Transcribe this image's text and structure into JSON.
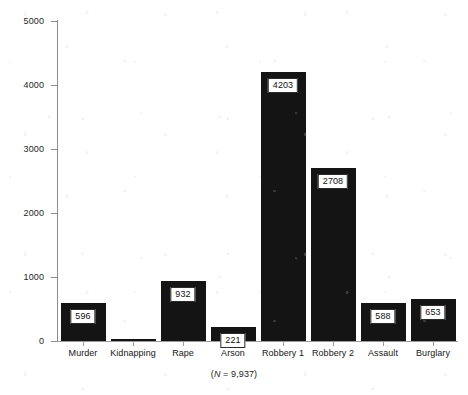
{
  "chart_data": {
    "type": "bar",
    "title": "",
    "subtitle": "",
    "xlabel": "",
    "ylabel": "",
    "categories": [
      "Murder",
      "Kidnapping",
      "Rape",
      "Arson",
      "Robbery 1",
      "Robbery 2",
      "Assault",
      "Burglary"
    ],
    "values": [
      596,
      36,
      932,
      221,
      4203,
      2708,
      588,
      653
    ],
    "value_labels": [
      "596",
      "",
      "932",
      "221",
      "4203",
      "2708",
      "588",
      "653"
    ],
    "ylim": [
      0,
      5000
    ],
    "yticks": [
      0,
      1000,
      2000,
      3000,
      4000,
      5000
    ],
    "ytick_labels": [
      "0",
      "1000",
      "2000",
      "3000",
      "4000",
      "5000"
    ],
    "grid": false,
    "legend": null,
    "bar_color": "#141414",
    "annotation": "(N = 9,937)",
    "annotation_prefix": "(",
    "annotation_symbol": "N",
    "annotation_suffix": " = 9,937)"
  },
  "axes": {
    "axis_color": "#8d8d8d",
    "tick_label_color": "#1e1e1e"
  }
}
